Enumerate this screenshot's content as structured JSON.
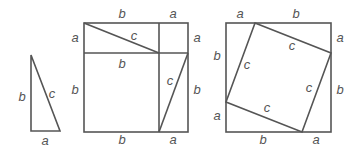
{
  "diagram": {
    "triangle": {
      "labels": {
        "leg_vertical": "b",
        "hypotenuse": "c",
        "leg_horizontal": "a"
      }
    },
    "square_left": {
      "top_labels": [
        "b",
        "a"
      ],
      "left_labels": [
        "a",
        "b"
      ],
      "right_labels": [
        "a",
        "b"
      ],
      "bottom_labels": [
        "b",
        "a"
      ],
      "inner_labels": {
        "hyp_top": "c",
        "middle_b": "b",
        "hyp_right": "c"
      }
    },
    "square_right": {
      "top_labels": [
        "a",
        "b"
      ],
      "left_labels": [
        "b",
        "a"
      ],
      "right_labels": [
        "a",
        "b"
      ],
      "bottom_labels": [
        "b",
        "a"
      ],
      "inner_labels": [
        "c",
        "c",
        "c",
        "c"
      ]
    }
  }
}
